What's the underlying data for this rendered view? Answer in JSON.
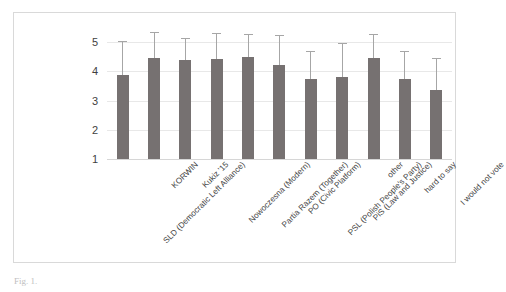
{
  "figure": {
    "caption": "Fig. 1."
  },
  "chart_data": {
    "type": "bar",
    "title": "",
    "xlabel": "",
    "ylabel": "",
    "ylim": [
      1,
      5
    ],
    "grid": true,
    "legend": "none",
    "yticks": [
      "1",
      "2",
      "3",
      "4",
      "5"
    ],
    "error_bars": "upper whisker only (lower whisker hidden behind bar)",
    "categories": [
      "SLD (Democratic Left Alliance)",
      "KORWIN",
      "Kukiz '15",
      "Nowoczesna (Modern)",
      "Partia Razem (Together)",
      "PO (Civic Platform)",
      "PSL (Polish People's Party)",
      "PiS (Law and Justice)",
      "other",
      "hard to say",
      "I would not vote"
    ],
    "values": [
      3.88,
      4.45,
      4.38,
      4.42,
      4.48,
      4.23,
      3.73,
      3.82,
      4.45,
      3.74,
      3.35
    ],
    "error_upper": [
      5.03,
      5.33,
      5.15,
      5.3,
      5.28,
      5.23,
      4.7,
      4.95,
      5.27,
      4.7,
      4.45
    ],
    "bar_color": "#767171",
    "gridline_color": "#e8e8e8",
    "error_bar_color": "#a6a6a6"
  }
}
